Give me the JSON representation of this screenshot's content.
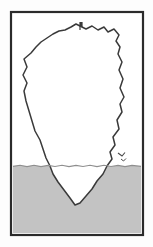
{
  "figure": {
    "caption": "",
    "kind": "illustration",
    "canvas": {
      "width": 153,
      "height": 247
    },
    "colors": {
      "page_background": "#fdfdfd",
      "frame_stroke": "#2b2b2b",
      "panel_fill": "#ffffff",
      "water_fill": "#c3c3c3",
      "water_edge": "#8f8f8f",
      "iceberg_fill": "#ffffff",
      "iceberg_stroke": "#3a3a3a",
      "bird_stroke": "#4a4a4a",
      "mast_stroke": "#3a3a3a"
    },
    "frame": {
      "name": "picture-frame",
      "x": 11,
      "y": 12,
      "width": 132,
      "height": 223,
      "stroke_width": 2.2
    },
    "waterline": {
      "name": "waterline",
      "y": 166,
      "label": "sea surface",
      "wave_amplitude": 1.6,
      "path": "M 13,166.4 L 20,165.2 L 27,166.6 L 34,165.3 L 41,166.6 L 48,165.4 L 55,166.5 L 62,165.3 L 69,166.6 L 76,165.4 L 83,166.5 L 90,165.3 L 97,166.6 L 104,165.3 L 111,166.5 L 118,165.4 L 125,166.6 L 132,165.4 L 141,166.4"
    },
    "water": {
      "name": "water-body",
      "fill_region": "M 13,166.4 L 20,165.2 L 27,166.6 L 34,165.3 L 41,166.6 L 48,165.4 L 55,166.5 L 62,165.3 L 69,166.6 L 76,165.4 L 83,166.5 L 90,165.3 L 97,166.6 L 104,165.3 L 111,166.5 L 118,165.4 L 125,166.6 L 132,165.4 L 141,166.4 L 141,233 L 13,233 Z",
      "depth_top": 166,
      "depth_bottom": 233
    },
    "iceberg": {
      "name": "iceberg",
      "above_water_label": "tip above water",
      "below_water_label": "mass below water",
      "outline_path": "M 80,26 L 86,29 L 92,26 L 98,30 L 104,27 L 108,32 L 114,29 L 119,35 L 116,41 L 120,47 L 118,54 L 122,62 L 119,70 L 123,79 L 120,88 L 124,97 L 120,104 L 122,112 L 117,120 L 119,129 L 113,137 L 115,145 L 110,152 L 112,159 L 107,166 L 103,174 L 97,181 L 92,189 L 86,196 L 80,203 L 75,205 L 70,198 L 64,190 L 58,182 L 53,174 L 50,166 L 46,158 L 43,149 L 40,140 L 35,131 L 32,121 L 29,111 L 26,101 L 24,91 L 27,83 L 23,75 L 27,67 L 24,59 L 31,53 L 36,47 L 41,42 L 47,38 L 53,34 L 59,31 L 65,30 L 71,27 L 76,24 Z",
      "left_extreme_x": 23,
      "right_extreme_x": 124,
      "top_y": 24,
      "bottom_tip_y": 205
    },
    "mast": {
      "name": "mast-marker",
      "description": "small vertical pole at the summit",
      "x": 80,
      "y_top": 22,
      "y_bottom": 30
    },
    "bird": {
      "name": "bird-mark",
      "description": "small bird glyph over the water near the right edge",
      "x": 122,
      "y": 155
    }
  }
}
